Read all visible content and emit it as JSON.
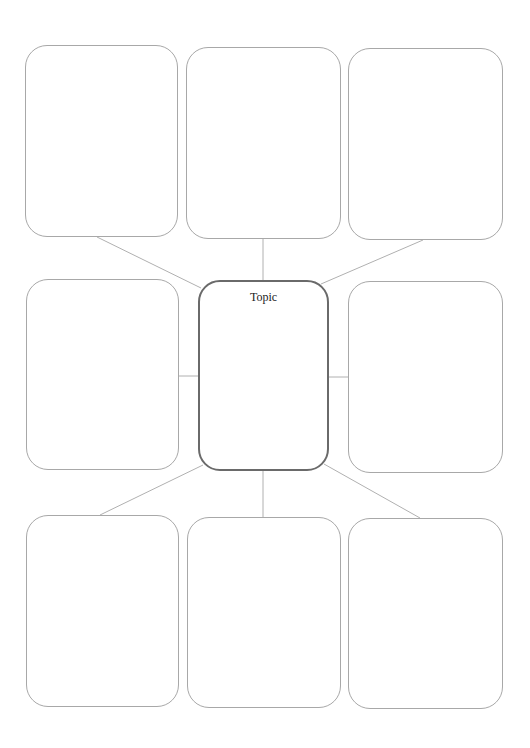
{
  "diagram": {
    "type": "graphic-organizer-spider-map",
    "center": {
      "label": "Topic"
    },
    "colors": {
      "background": "#ffffff",
      "box_border": "#a8a8a8",
      "center_border": "#6a6a6a",
      "connector": "#b0b0b0",
      "text": "#222222"
    },
    "boxes": [
      {
        "id": "top-left",
        "label": ""
      },
      {
        "id": "top-middle",
        "label": ""
      },
      {
        "id": "top-right",
        "label": ""
      },
      {
        "id": "middle-left",
        "label": ""
      },
      {
        "id": "middle-right",
        "label": ""
      },
      {
        "id": "bottom-left",
        "label": ""
      },
      {
        "id": "bottom-middle",
        "label": ""
      },
      {
        "id": "bottom-right",
        "label": ""
      }
    ]
  }
}
